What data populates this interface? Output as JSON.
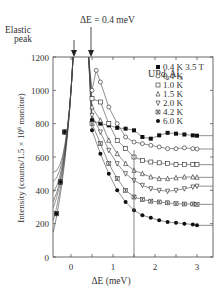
{
  "chart_data": {
    "type": "scatter",
    "title": "",
    "sample_label": "UPd2Al3",
    "xlabel": "ΔE (meV)",
    "ylabel": "Intensity (counts/1.5 × 10^6 monitor)",
    "xlim": [
      -0.45,
      3.35
    ],
    "ylim": [
      0,
      1200
    ],
    "x_ticks": [
      0,
      1,
      2,
      3
    ],
    "y_ticks": [
      0,
      200,
      400,
      600,
      800,
      1000,
      1200
    ],
    "grid": false,
    "legend_position": "upper right",
    "annotations": [
      {
        "text": "Elastic peak",
        "x": 0.05,
        "arrow_to_y": 1200
      },
      {
        "text": "ΔE = 0.4 meV",
        "x": 0.4,
        "arrow_to_y": 1200
      }
    ],
    "vertical_marker_x": 1.5,
    "series": [
      {
        "name": "0.4 K 3.5 T",
        "marker": "filled-square",
        "x": [
          0.5,
          0.7,
          0.9,
          1.1,
          1.3,
          1.5,
          1.7,
          1.9,
          2.1,
          2.3,
          2.5,
          2.7,
          2.9,
          3.0
        ],
        "y": [
          820,
          800,
          790,
          775,
          770,
          760,
          720,
          710,
          730,
          745,
          740,
          735,
          730,
          728
        ]
      },
      {
        "name": "0.4 K",
        "marker": "open-circle",
        "x": [
          0.5,
          0.6,
          0.7,
          0.9,
          1.1,
          1.3,
          1.5,
          1.7,
          1.9,
          2.1,
          2.3,
          2.5,
          2.7,
          2.9,
          3.0
        ],
        "y": [
          1000,
          1120,
          1050,
          900,
          800,
          720,
          690,
          680,
          670,
          660,
          650,
          650,
          655,
          650,
          648
        ]
      },
      {
        "name": "1.0 K",
        "marker": "open-square",
        "x": [
          0.5,
          0.7,
          0.9,
          1.1,
          1.3,
          1.5,
          1.7,
          1.9,
          2.1,
          2.3,
          2.5,
          2.7,
          2.9,
          3.0
        ],
        "y": [
          950,
          930,
          800,
          700,
          650,
          600,
          580,
          570,
          565,
          560,
          555,
          555,
          556,
          554
        ]
      },
      {
        "name": "1.5 K",
        "marker": "open-triangle-up",
        "x": [
          0.5,
          0.7,
          0.9,
          1.1,
          1.3,
          1.5,
          1.7,
          1.9,
          2.1,
          2.3,
          2.5,
          2.7,
          2.9,
          3.0
        ],
        "y": [
          900,
          820,
          700,
          620,
          560,
          520,
          500,
          480,
          470,
          470,
          475,
          480,
          480,
          478
        ]
      },
      {
        "name": "2.0 K",
        "marker": "open-triangle-down",
        "x": [
          0.5,
          0.7,
          0.9,
          1.1,
          1.3,
          1.5,
          1.7,
          1.9,
          2.1,
          2.3,
          2.5,
          2.7,
          2.9,
          3.0
        ],
        "y": [
          850,
          750,
          640,
          560,
          500,
          460,
          430,
          410,
          400,
          395,
          400,
          410,
          420,
          425
        ]
      },
      {
        "name": "4.2 K",
        "marker": "asterisk-square",
        "x": [
          0.5,
          0.7,
          0.9,
          1.1,
          1.3,
          1.5,
          1.7,
          1.9,
          2.1,
          2.3,
          2.5,
          2.7,
          2.9,
          3.0
        ],
        "y": [
          800,
          680,
          560,
          470,
          400,
          360,
          345,
          335,
          330,
          325,
          320,
          318,
          318,
          316
        ]
      },
      {
        "name": "6.0 K",
        "marker": "filled-circle",
        "x": [
          0.5,
          0.7,
          0.9,
          1.1,
          1.3,
          1.5,
          1.7,
          1.9,
          2.1,
          2.3,
          2.5,
          2.7,
          2.9,
          3.0
        ],
        "y": [
          760,
          620,
          500,
          400,
          330,
          280,
          250,
          235,
          220,
          210,
          205,
          200,
          195,
          190
        ]
      }
    ]
  },
  "legend": {
    "title": "UPd2Al3",
    "entries": [
      "0.4 K 3.5 T",
      "0.4 K",
      "1.0 K",
      "1.5 K",
      "2.0 K",
      "4.2 K",
      "6.0 K"
    ]
  },
  "axes": {
    "xlabel_prefix": "ΔE",
    "xlabel_suffix": " (meV)",
    "ylabel": "Intensity (counts/1.5 × 10",
    "ylabel_exp": "6",
    "ylabel_end": " monitor)",
    "y_tick_labels": [
      "0",
      "200",
      "400",
      "600",
      "800",
      "1000",
      "1200"
    ],
    "x_tick_labels": [
      "0",
      "1",
      "2",
      "3"
    ]
  },
  "annotations": {
    "elastic_line1": "Elastic",
    "elastic_line2": "peak",
    "delta_e": "ΔE = 0.4 meV"
  },
  "sample": {
    "main": "UPd",
    "sub1": "2",
    "mid": "Al",
    "sub2": "3"
  }
}
